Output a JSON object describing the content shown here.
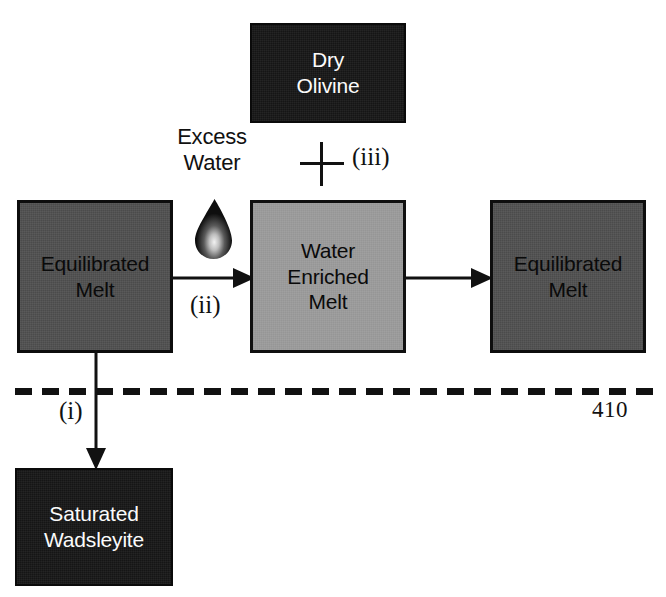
{
  "figure": {
    "background_color": "#ffffff",
    "colors": {
      "black_box": "#151515",
      "dark_gray_box": "#4b4b4b",
      "light_gray_box": "#9b9b9b",
      "stroke": "#111111",
      "white_text": "#fbfbfb",
      "black_text": "#0a0a0a"
    }
  },
  "boxes": {
    "dry_olivine": {
      "line1": "Dry",
      "line2": "Olivine",
      "fill": "black",
      "text_color": "#fbfbfb"
    },
    "equilibrated_melt_left": {
      "line1": "Equilibrated",
      "line2": "Melt",
      "fill": "dark-gray",
      "text_color": "#0a0a0a"
    },
    "water_enriched_melt": {
      "line1": "Water",
      "line2": "Enriched",
      "line3": "Melt",
      "fill": "light-gray",
      "text_color": "#0a0a0a"
    },
    "equilibrated_melt_right": {
      "line1": "Equilibrated",
      "line2": "Melt",
      "fill": "dark-gray",
      "text_color": "#0a0a0a"
    },
    "saturated_wadsleyite": {
      "line1": "Saturated",
      "line2": "Wadsleyite",
      "fill": "black",
      "text_color": "#fbfbfb"
    }
  },
  "labels": {
    "excess_water_line1": "Excess",
    "excess_water_line2": "Water",
    "step_i": "(i)",
    "step_ii": "(ii)",
    "step_iii": "(iii)",
    "depth_410": "410",
    "plus_symbol": "+"
  },
  "icons": {
    "water_droplet": "water-droplet-icon",
    "plus": "plus-icon",
    "arrow_right": "arrow-right-icon",
    "arrow_down": "arrow-down-icon",
    "dashed_line": "dashed-depth-line"
  }
}
